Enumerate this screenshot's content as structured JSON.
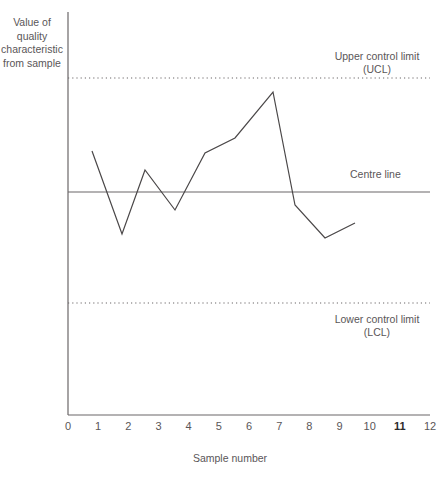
{
  "labels": {
    "y_axis": "Value of\nquality\ncharacteristic\nfrom sample",
    "x_axis": "Sample number",
    "ucl": "Upper control limit\n(UCL)",
    "lcl": "Lower control limit\n(LCL)",
    "centre": "Centre line"
  },
  "colors": {
    "axis": "#6b6768",
    "line": "#4a4748",
    "limit": "#6b6768",
    "text": "#5a5658",
    "text_emphasis": "#2c2a2b",
    "background": "#ffffff"
  },
  "ticks": [
    {
      "label": "0",
      "value": 0,
      "emphasis": false
    },
    {
      "label": "1",
      "value": 1,
      "emphasis": false
    },
    {
      "label": "2",
      "value": 2,
      "emphasis": false
    },
    {
      "label": "3",
      "value": 3,
      "emphasis": false
    },
    {
      "label": "4",
      "value": 4,
      "emphasis": false
    },
    {
      "label": "5",
      "value": 5,
      "emphasis": false
    },
    {
      "label": "6",
      "value": 6,
      "emphasis": false
    },
    {
      "label": "7",
      "value": 7,
      "emphasis": false
    },
    {
      "label": "8",
      "value": 8,
      "emphasis": false
    },
    {
      "label": "9",
      "value": 9,
      "emphasis": false
    },
    {
      "label": "10",
      "value": 10,
      "emphasis": false
    },
    {
      "label": "11",
      "value": 11,
      "emphasis": true
    },
    {
      "label": "12",
      "value": 12,
      "emphasis": false
    }
  ],
  "chart_data": {
    "type": "line",
    "title": "",
    "xlabel": "Sample number",
    "ylabel": "Value of quality characteristic from sample",
    "xlim": [
      0,
      12
    ],
    "ylim": [
      0,
      100
    ],
    "grid": false,
    "legend": "none",
    "x": [
      1,
      2,
      3,
      4,
      5,
      6,
      7,
      8,
      9,
      10
    ],
    "values": [
      66,
      45,
      60,
      50,
      65,
      69,
      85,
      51,
      43,
      47
    ],
    "series": [
      {
        "name": "Sample value",
        "x": [
          1,
          2,
          3,
          4,
          5,
          6,
          7,
          8,
          9,
          10
        ],
        "values": [
          66,
          45,
          60,
          50,
          65,
          69,
          85,
          51,
          43,
          47
        ]
      }
    ],
    "reference_lines": [
      {
        "name": "Upper control limit (UCL)",
        "value": 89,
        "style": "dotted"
      },
      {
        "name": "Centre line",
        "value": 56,
        "style": "solid"
      },
      {
        "name": "Lower control limit (LCL)",
        "value": 29,
        "style": "dotted"
      }
    ],
    "annotations": [
      {
        "text": "Upper control limit (UCL)",
        "target": "ucl"
      },
      {
        "text": "Centre line",
        "target": "centre"
      },
      {
        "text": "Lower control limit (LCL)",
        "target": "lcl"
      }
    ]
  },
  "geometry": {
    "axis_x": 68,
    "axis_y_top": 12,
    "axis_y_bottom": 415,
    "axis_x_right": 430,
    "unit_px": 30.17,
    "ucl_y": 78,
    "centre_y": 192,
    "lcl_y": 303,
    "points": [
      [
        92,
        151
      ],
      [
        122,
        234
      ],
      [
        145,
        170
      ],
      [
        175,
        210
      ],
      [
        205,
        153
      ],
      [
        235,
        138
      ],
      [
        273,
        92
      ],
      [
        295,
        205
      ],
      [
        325,
        238
      ],
      [
        355,
        223
      ]
    ]
  }
}
